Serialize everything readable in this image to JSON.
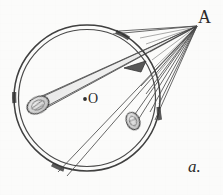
{
  "figure": {
    "kind": "hand-drawn-geometry-diagram",
    "caption_label": "a.",
    "background_color": "#fbfbfa",
    "ink_color": "#3a3a3a",
    "shade_color": "#7a7a7a"
  },
  "labels": {
    "external_point": "A",
    "center_point": "O",
    "figure_index": "a."
  },
  "geometry": {
    "circle": {
      "name": "main-circle",
      "center_x": 87,
      "center_y": 98,
      "radius": 73,
      "stroke_style": "double-line",
      "inner_radius": 69
    },
    "center_dot": {
      "x": 85,
      "y": 99,
      "r": 2
    },
    "apex": {
      "name": "point-A",
      "x": 197,
      "y": 26
    },
    "rays": [
      {
        "name": "ray-1",
        "x2": 33,
        "y2": 102
      },
      {
        "name": "ray-2",
        "x2": 36,
        "y2": 112
      },
      {
        "name": "ray-3",
        "x2": 60,
        "y2": 174
      },
      {
        "name": "ray-4",
        "x2": 68,
        "y2": 176
      },
      {
        "name": "ray-5",
        "x2": 126,
        "y2": 124
      },
      {
        "name": "ray-6",
        "x2": 131,
        "y2": 127
      },
      {
        "name": "ray-7",
        "x2": 150,
        "y2": 110
      },
      {
        "name": "ray-8",
        "x2": 152,
        "y2": 118
      },
      {
        "name": "ray-9",
        "x2": 155,
        "y2": 100
      },
      {
        "name": "ray-10",
        "x2": 118,
        "y2": 30
      },
      {
        "name": "ray-11",
        "x2": 112,
        "y2": 33
      }
    ],
    "cone": {
      "name": "light-cone",
      "apex_x": 197,
      "apex_y": 26,
      "base_a_x": 33,
      "base_a_y": 100,
      "base_b_x": 37,
      "base_b_y": 113
    },
    "objects": [
      {
        "name": "left-aperture-ellipse",
        "cx": 38,
        "cy": 105,
        "rx": 11,
        "ry": 8,
        "rotate": -28
      },
      {
        "name": "lower-aperture-ellipse",
        "cx": 133,
        "cy": 121,
        "rx": 7,
        "ry": 9,
        "rotate": -20
      }
    ],
    "arrowhead": {
      "name": "ray-arrowhead",
      "x": 135,
      "y": 68,
      "angle": 205
    },
    "arc_marks": [
      {
        "name": "arc-mark-top",
        "cx": 87,
        "cy": 98,
        "r": 71,
        "start_deg": -66,
        "end_deg": -55
      },
      {
        "name": "arc-mark-right",
        "cx": 87,
        "cy": 98,
        "r": 71,
        "start_deg": 7,
        "end_deg": 19
      },
      {
        "name": "arc-mark-bottom-left",
        "cx": 87,
        "cy": 98,
        "r": 71,
        "start_deg": 110,
        "end_deg": 122
      },
      {
        "name": "arc-mark-left",
        "cx": 87,
        "cy": 98,
        "r": 71,
        "start_deg": 176,
        "end_deg": 186
      }
    ]
  }
}
